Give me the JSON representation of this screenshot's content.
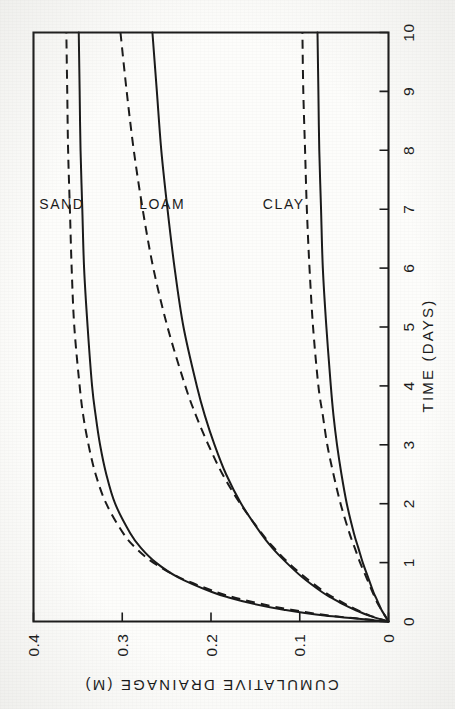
{
  "figure": {
    "orientation_note": "rotated-90-ccw",
    "background_color": "#fdfdfb",
    "ink_color": "#1b1b1b"
  },
  "chart_data": {
    "type": "line",
    "title": "",
    "xlabel": "TIME (DAYS)",
    "ylabel": "CUMULATIVE DRAINAGE (M)",
    "xlim": [
      0,
      10
    ],
    "ylim": [
      0,
      0.4
    ],
    "xticks": [
      0,
      1,
      2,
      3,
      4,
      5,
      6,
      7,
      8,
      9,
      10
    ],
    "xtick_labels": [
      "0",
      "1",
      "2",
      "3",
      "4",
      "5",
      "6",
      "7",
      "8",
      "9",
      "10"
    ],
    "yticks": [
      0,
      0.1,
      0.2,
      0.3,
      0.4
    ],
    "ytick_labels": [
      "0",
      "0.1",
      "0.2",
      "0.3",
      "0.4"
    ],
    "grid": false,
    "legend": "inline-annotations",
    "annotations": [
      {
        "text": "SAND",
        "x": 7.0,
        "y": 0.368
      },
      {
        "text": "LOAM",
        "x": 7.0,
        "y": 0.255
      },
      {
        "text": "CLAY",
        "x": 7.0,
        "y": 0.118
      }
    ],
    "x": [
      0,
      0.1,
      0.2,
      0.3,
      0.4,
      0.5,
      0.75,
      1,
      1.25,
      1.5,
      2,
      2.5,
      3,
      3.5,
      4,
      5,
      6,
      7,
      8,
      9,
      10
    ],
    "series": [
      {
        "name": "SAND (solid)",
        "group": "SAND",
        "style": "solid",
        "values": [
          0,
          0.072,
          0.118,
          0.152,
          0.178,
          0.199,
          0.237,
          0.262,
          0.279,
          0.291,
          0.308,
          0.318,
          0.325,
          0.33,
          0.334,
          0.339,
          0.343,
          0.345,
          0.347,
          0.348,
          0.349
        ]
      },
      {
        "name": "SAND (dashed)",
        "group": "SAND",
        "style": "dashed",
        "values": [
          0,
          0.066,
          0.11,
          0.144,
          0.172,
          0.194,
          0.236,
          0.265,
          0.285,
          0.299,
          0.318,
          0.33,
          0.338,
          0.344,
          0.348,
          0.354,
          0.357,
          0.359,
          0.361,
          0.362,
          0.363
        ]
      },
      {
        "name": "LOAM (solid)",
        "group": "LOAM",
        "style": "solid",
        "values": [
          0,
          0.022,
          0.038,
          0.052,
          0.064,
          0.075,
          0.097,
          0.115,
          0.131,
          0.144,
          0.166,
          0.183,
          0.196,
          0.207,
          0.216,
          0.231,
          0.241,
          0.249,
          0.256,
          0.261,
          0.266
        ]
      },
      {
        "name": "LOAM (dashed)",
        "group": "LOAM",
        "style": "dashed",
        "values": [
          0,
          0.021,
          0.036,
          0.049,
          0.061,
          0.072,
          0.094,
          0.113,
          0.129,
          0.143,
          0.167,
          0.187,
          0.203,
          0.217,
          0.229,
          0.249,
          0.265,
          0.277,
          0.287,
          0.295,
          0.302
        ]
      },
      {
        "name": "CLAY (solid)",
        "group": "CLAY",
        "style": "solid",
        "values": [
          0,
          0.004,
          0.008,
          0.011,
          0.014,
          0.017,
          0.023,
          0.029,
          0.034,
          0.039,
          0.047,
          0.053,
          0.058,
          0.062,
          0.065,
          0.07,
          0.074,
          0.076,
          0.078,
          0.079,
          0.08
        ]
      },
      {
        "name": "CLAY (dashed)",
        "group": "CLAY",
        "style": "dashed",
        "values": [
          0,
          0.004,
          0.008,
          0.012,
          0.015,
          0.018,
          0.025,
          0.032,
          0.038,
          0.044,
          0.054,
          0.062,
          0.069,
          0.074,
          0.079,
          0.085,
          0.089,
          0.092,
          0.094,
          0.096,
          0.097
        ]
      }
    ]
  },
  "axis": {
    "x_title": "TIME (DAYS)",
    "y_title": "CUMULATIVE DRAINAGE (M)",
    "x_ticks": [
      "0",
      "1",
      "2",
      "3",
      "4",
      "5",
      "6",
      "7",
      "8",
      "9",
      "10"
    ],
    "y_ticks": [
      "0.4",
      "0.3",
      "0.2",
      "0.1",
      "0"
    ]
  },
  "labels": {
    "sand": "SAND",
    "loam": "LOAM",
    "clay": "CLAY"
  }
}
